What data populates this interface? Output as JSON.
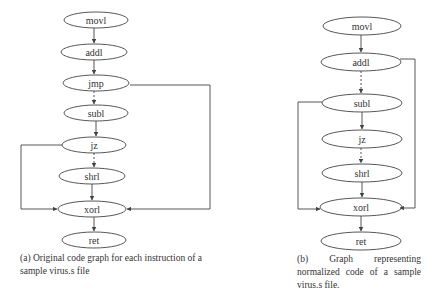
{
  "figure": {
    "subfigure_a": {
      "caption": "(a) Original code graph for each instruction of a sample virus.s file",
      "nodes": [
        "movl",
        "addl",
        "jmp",
        "subl",
        "jz",
        "shrl",
        "xorl",
        "ret"
      ],
      "edges": [
        {
          "from": "movl",
          "to": "addl",
          "style": "solid"
        },
        {
          "from": "addl",
          "to": "jmp",
          "style": "solid"
        },
        {
          "from": "jmp",
          "to": "subl",
          "style": "dashed"
        },
        {
          "from": "subl",
          "to": "jz",
          "style": "solid"
        },
        {
          "from": "jz",
          "to": "shrl",
          "style": "dashed"
        },
        {
          "from": "shrl",
          "to": "xorl",
          "style": "solid"
        },
        {
          "from": "xorl",
          "to": "ret",
          "style": "solid"
        },
        {
          "from": "jmp",
          "to": "xorl",
          "style": "solid",
          "route": "right"
        },
        {
          "from": "jz",
          "to": "xorl",
          "style": "solid",
          "route": "left"
        }
      ]
    },
    "subfigure_b": {
      "caption": "(b) Graph representing normalized code of a sample virus.s file.",
      "nodes": [
        "movl",
        "addl",
        "subl",
        "jz",
        "shrl",
        "xorl",
        "ret"
      ],
      "edges": [
        {
          "from": "movl",
          "to": "addl",
          "style": "solid"
        },
        {
          "from": "addl",
          "to": "subl",
          "style": "dashed"
        },
        {
          "from": "subl",
          "to": "jz",
          "style": "solid"
        },
        {
          "from": "jz",
          "to": "shrl",
          "style": "dashed"
        },
        {
          "from": "shrl",
          "to": "xorl",
          "style": "solid"
        },
        {
          "from": "xorl",
          "to": "ret",
          "style": "solid"
        },
        {
          "from": "addl",
          "to": "xorl",
          "style": "solid",
          "route": "right"
        },
        {
          "from": "subl",
          "to": "xorl",
          "style": "solid",
          "route": "left"
        }
      ]
    }
  }
}
